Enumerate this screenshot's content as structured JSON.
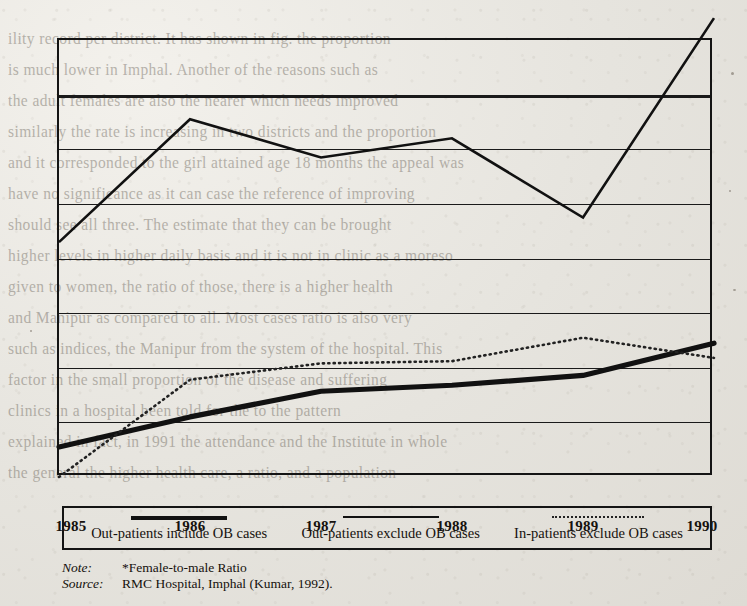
{
  "chart_data": {
    "type": "line",
    "title": "",
    "xlabel": "",
    "ylabel": "",
    "categories": [
      "1985",
      "1986",
      "1987",
      "1988",
      "1989",
      "1990"
    ],
    "x": [
      1985,
      1986,
      1987,
      1988,
      1989,
      1990
    ],
    "ylim": [
      0.6,
      1.4
    ],
    "xlim": [
      1985,
      1990
    ],
    "yticks": [
      "0.6",
      "0.7",
      "0.8",
      "0.9",
      "1",
      "1.1",
      "1.2",
      "1.3",
      "1.4"
    ],
    "ytick_values": [
      0.6,
      0.7,
      0.8,
      0.9,
      1.0,
      1.1,
      1.2,
      1.3,
      1.4
    ],
    "ytick_top_marker": "*",
    "grid": true,
    "legend_position": "bottom",
    "series": [
      {
        "name": "Out-patients include OB cases",
        "style": "thin-solid",
        "color": "#111111",
        "values": [
          1.03,
          1.255,
          1.185,
          1.22,
          1.075,
          1.44
        ]
      },
      {
        "name": "Out-patients exclude OB cases",
        "style": "thick-solid",
        "color": "#111111",
        "values": [
          0.655,
          0.71,
          0.757,
          0.768,
          0.786,
          0.845
        ]
      },
      {
        "name": "In-patients exclude OB cases",
        "style": "dotted",
        "color": "#222222",
        "values": [
          0.6,
          0.778,
          0.808,
          0.812,
          0.855,
          0.818
        ]
      }
    ]
  },
  "legend": {
    "items": [
      {
        "label": "Out-patients include OB cases",
        "swatch": "thick-line-swatch"
      },
      {
        "label": "Out-patients exclude OB cases",
        "swatch": "thin-line-swatch"
      },
      {
        "label": "In-patients exclude OB cases",
        "swatch": "dotted-line-swatch"
      }
    ]
  },
  "footnotes": {
    "note_label": "Note:",
    "note_value": "*Female-to-male Ratio",
    "source_label": "Source:",
    "source_value": "RMC Hospital, Imphal (Kumar, 1992)."
  },
  "background_text": {
    "lines": [
      "ility record per district. It has shown in fig. the proportion",
      "is much lower in Imphal. Another of the reasons such as",
      "the adult females are also the nearer which needs improved",
      "similarly the rate is increasing in two districts and the proportion",
      "and it corresponded to the girl attained age 18 months the appeal was",
      "have no significance as it can case the reference of improving",
      "should see all three.  The estimate that they can be brought",
      "higher levels in higher daily basis and it is not in clinic as a  moreso",
      "given to women, the ratio of those, there is a higher health",
      "and Manipur as compared to all.  Most cases ratio is also very",
      "such as indices, the Manipur from the system of the hospital. This",
      "factor in the small proportion of the disease  and  suffering",
      "clinics in a hospital  been told  for the  to  the  pattern",
      "explained in fact, in 1991 the attendance and the Institute in whole",
      "the general  the higher health care,  a ratio, and a population"
    ]
  }
}
